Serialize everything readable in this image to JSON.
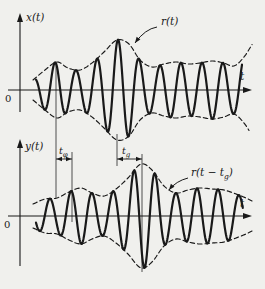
{
  "figure": {
    "width": 265,
    "height": 289,
    "background": "#f0f0ed",
    "ink": "#191919",
    "plots": [
      {
        "id": "input-signal-plot",
        "ylabel": {
          "text": "x(t)",
          "x": 26,
          "y": 21
        },
        "xlabel": {
          "text": "t",
          "x": 240,
          "y": 80
        },
        "zero": {
          "text": "0",
          "x": 5,
          "y": 102
        },
        "axis": {
          "hx0": 8,
          "hx1": 252,
          "hy": 90,
          "vx": 20,
          "vy_top": 13,
          "vy_bottom": 112
        },
        "carrier": {
          "period": 21,
          "crest": 55
        },
        "signal_range": [
          36,
          242
        ],
        "envelope_range_upper": [
          33,
          253
        ],
        "envelope_range_lower": [
          33,
          249
        ],
        "envelope_points": [
          [
            33,
            10
          ],
          [
            45,
            20
          ],
          [
            57,
            28
          ],
          [
            68,
            22
          ],
          [
            80,
            20
          ],
          [
            92,
            27
          ],
          [
            104,
            38
          ],
          [
            117,
            50
          ],
          [
            129,
            46
          ],
          [
            140,
            30
          ],
          [
            152,
            23
          ],
          [
            164,
            26
          ],
          [
            176,
            28
          ],
          [
            188,
            26
          ],
          [
            200,
            27
          ],
          [
            212,
            29
          ],
          [
            224,
            27
          ],
          [
            234,
            24
          ],
          [
            244,
            33
          ],
          [
            253,
            47
          ]
        ],
        "annotation": {
          "parts": [
            {
              "t": "r(t)",
              "sub": false
            }
          ],
          "x": 161,
          "y": 25,
          "curve": {
            "x1": 157,
            "y1": 27,
            "cx": 145,
            "cy": 29,
            "x2": 135,
            "y2": 43
          }
        }
      },
      {
        "id": "output-signal-plot",
        "ylabel": {
          "text": "y(t)",
          "x": 25,
          "y": 150
        },
        "xlabel": {
          "text": "t",
          "x": 240,
          "y": 207
        },
        "zero": {
          "text": "0",
          "x": 4,
          "y": 228
        },
        "axis": {
          "hx0": 8,
          "hx1": 252,
          "hy": 216,
          "vx": 20,
          "vy_top": 139,
          "vy_bottom": 266
        },
        "carrier": {
          "period": 21,
          "crest": 71
        },
        "signal_range": [
          36,
          243
        ],
        "envelope_range_upper": [
          33,
          252
        ],
        "envelope_range_lower": [
          33,
          252
        ],
        "envelope_points": [
          [
            33,
            12
          ],
          [
            45,
            17
          ],
          [
            57,
            18
          ],
          [
            69,
            24
          ],
          [
            81,
            28
          ],
          [
            92,
            23
          ],
          [
            104,
            20
          ],
          [
            116,
            27
          ],
          [
            128,
            38
          ],
          [
            141,
            52
          ],
          [
            152,
            46
          ],
          [
            164,
            30
          ],
          [
            176,
            23
          ],
          [
            188,
            26
          ],
          [
            200,
            28
          ],
          [
            212,
            27
          ],
          [
            224,
            26
          ],
          [
            236,
            22
          ],
          [
            246,
            18
          ],
          [
            252,
            15
          ]
        ],
        "annotation": {
          "parts": [
            {
              "t": "r(t − t",
              "sub": false
            },
            {
              "t": "g",
              "sub": true
            },
            {
              "t": ")",
              "sub": false
            }
          ],
          "x": 191,
          "y": 176,
          "curve": {
            "x1": 188,
            "y1": 178,
            "cx": 176,
            "cy": 181,
            "x2": 169,
            "y2": 190
          }
        }
      }
    ],
    "delay_markers": [
      {
        "id": "phase-delay",
        "label": {
          "parts": [
            {
              "t": "t",
              "sub": false
            },
            {
              "t": "φ",
              "sub": true
            }
          ],
          "x": 59,
          "y": 154
        },
        "arrow": {
          "y": 159,
          "x1": 56,
          "x2": 72
        },
        "ref_lines": [
          {
            "x": 56,
            "y1": 63,
            "y2": 198
          },
          {
            "x": 72,
            "y1": 152,
            "y2": 222
          }
        ]
      },
      {
        "id": "group-delay",
        "label": {
          "parts": [
            {
              "t": "t",
              "sub": false
            },
            {
              "t": "g",
              "sub": true
            }
          ],
          "x": 122,
          "y": 154
        },
        "arrow": {
          "y": 159,
          "x1": 117,
          "x2": 142
        },
        "ref_lines": [
          {
            "x": 117,
            "y1": 134,
            "y2": 166
          },
          {
            "x": 142,
            "y1": 154,
            "y2": 272
          }
        ]
      }
    ]
  }
}
